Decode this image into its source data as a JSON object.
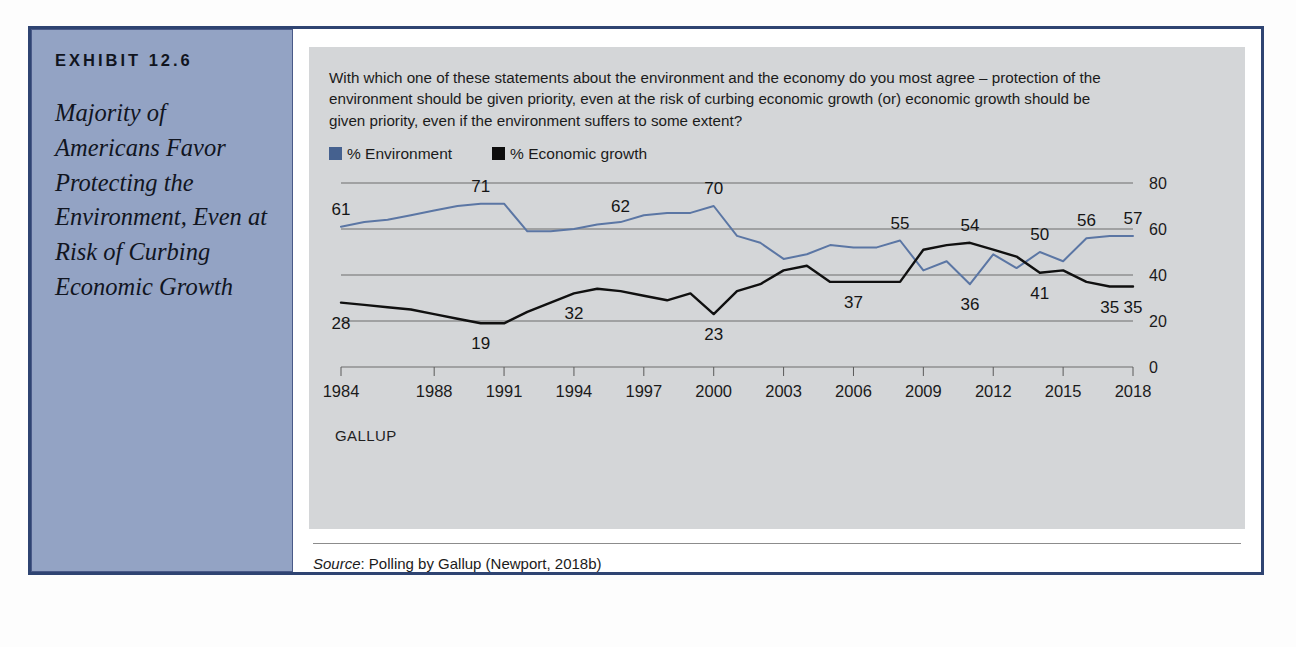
{
  "exhibit": {
    "label": "EXHIBIT 12.6",
    "title": "Majority of Americans Favor Protecting the Environment, Even at Risk of Curbing Economic Growth",
    "frame_color": "#2f4472",
    "sidebar_color": "#93a3c4"
  },
  "question": "With which one of these statements about the environment and the economy do you most agree – protection of the environment should be given priority, even at the risk of curbing economic growth (or) economic growth should be given priority, even if the environment suffers to some extent?",
  "attribution": "GALLUP",
  "source": {
    "label": "Source",
    "text": ": Polling by Gallup (Newport, 2018b)"
  },
  "chart_data": {
    "type": "line",
    "title": "",
    "xlabel": "",
    "ylabel": "",
    "ylim": [
      0,
      80
    ],
    "yticks": [
      0,
      20,
      40,
      60,
      80
    ],
    "grid": true,
    "legend_position": "top-left",
    "x_tick_labels": [
      "1984",
      "1988",
      "1991",
      "1994",
      "1997",
      "2000",
      "2003",
      "2006",
      "2009",
      "2012",
      "2015",
      "2018"
    ],
    "x": [
      1984,
      1985,
      1986,
      1987,
      1988,
      1989,
      1990,
      1991,
      1992,
      1993,
      1994,
      1995,
      1996,
      1997,
      1998,
      1999,
      2000,
      2001,
      2002,
      2003,
      2004,
      2005,
      2006,
      2007,
      2008,
      2009,
      2010,
      2011,
      2012,
      2013,
      2014,
      2015,
      2016,
      2017,
      2018
    ],
    "series": [
      {
        "name": "% Environment",
        "color": "#5b76a4",
        "values": [
          61,
          63,
          64,
          66,
          68,
          70,
          71,
          71,
          59,
          59,
          60,
          62,
          63,
          66,
          67,
          67,
          70,
          57,
          54,
          47,
          49,
          53,
          52,
          52,
          55,
          42,
          46,
          36,
          49,
          43,
          50,
          46,
          56,
          57,
          57
        ]
      },
      {
        "name": "% Economic growth",
        "color": "#101010",
        "values": [
          28,
          27,
          26,
          25,
          23,
          21,
          19,
          19,
          24,
          28,
          32,
          34,
          33,
          31,
          29,
          32,
          23,
          33,
          36,
          42,
          44,
          37,
          37,
          37,
          37,
          51,
          53,
          54,
          51,
          48,
          41,
          42,
          37,
          35,
          35
        ]
      }
    ],
    "point_labels": [
      {
        "series": "% Environment",
        "x": 1984,
        "value": 61
      },
      {
        "series": "% Environment",
        "x": 1990,
        "value": 71
      },
      {
        "series": "% Environment",
        "x": 1996,
        "value": 62
      },
      {
        "series": "% Environment",
        "x": 2000,
        "value": 70
      },
      {
        "series": "% Environment",
        "x": 2008,
        "value": 55
      },
      {
        "series": "% Environment",
        "x": 2011,
        "value": 54
      },
      {
        "series": "% Environment",
        "x": 2014,
        "value": 50
      },
      {
        "series": "% Environment",
        "x": 2016,
        "value": 56
      },
      {
        "series": "% Environment",
        "x": 2018,
        "value": 57
      },
      {
        "series": "% Economic growth",
        "x": 1984,
        "value": 28
      },
      {
        "series": "% Economic growth",
        "x": 1990,
        "value": 19
      },
      {
        "series": "% Economic growth",
        "x": 1994,
        "value": 32
      },
      {
        "series": "% Economic growth",
        "x": 2000,
        "value": 23
      },
      {
        "series": "% Economic growth",
        "x": 2006,
        "value": 37
      },
      {
        "series": "% Economic growth",
        "x": 2011,
        "value": 36
      },
      {
        "series": "% Economic growth",
        "x": 2014,
        "value": 41
      },
      {
        "series": "% Economic growth",
        "x": 2017,
        "value": 35
      },
      {
        "series": "% Economic growth",
        "x": 2018,
        "value": 35
      }
    ]
  }
}
